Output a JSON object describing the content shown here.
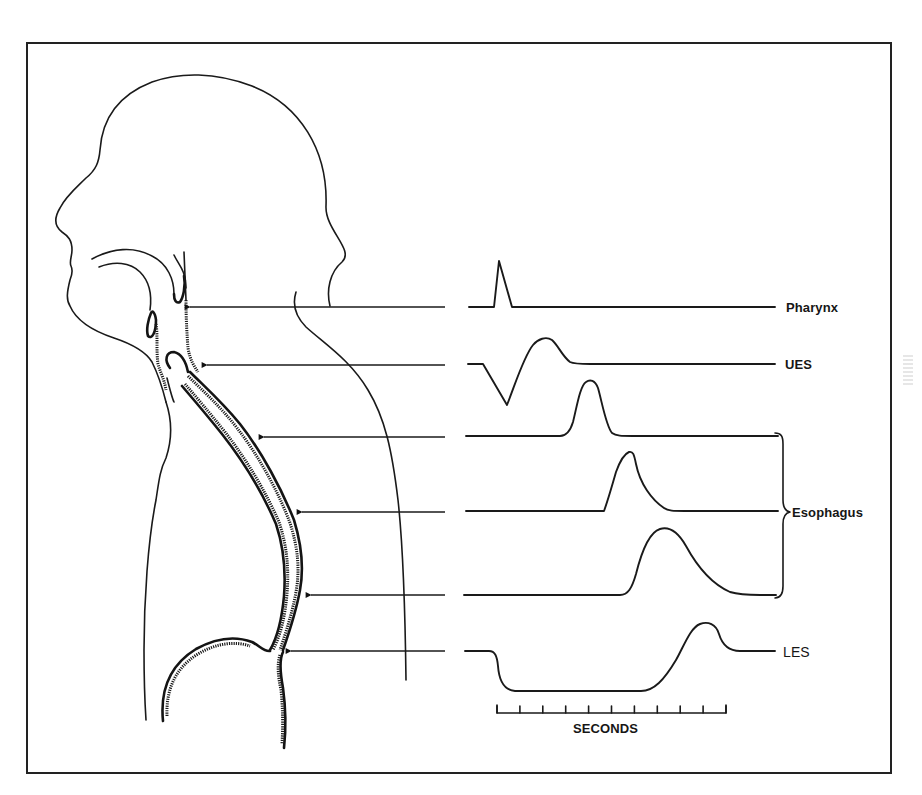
{
  "figure": {
    "type": "anatomical diagram with pressure tracings",
    "frame_color": "#222222",
    "ink_color": "#1a1a1a"
  },
  "labels": {
    "pharynx": "Pharynx",
    "ues": "UES",
    "esophagus": "Esophagus",
    "les": "LES",
    "time_axis": "SECONDS"
  },
  "probes": [
    {
      "name": "pharynx",
      "y": 307,
      "tip_x": 180,
      "line_end_x": 445
    },
    {
      "name": "ues",
      "y": 365,
      "tip_x": 197,
      "line_end_x": 445
    },
    {
      "name": "esophagus-upper",
      "y": 437,
      "tip_x": 254,
      "line_end_x": 445
    },
    {
      "name": "esophagus-middle",
      "y": 512,
      "tip_x": 294,
      "line_end_x": 445
    },
    {
      "name": "esophagus-lower",
      "y": 595,
      "tip_x": 303,
      "line_end_x": 445
    },
    {
      "name": "les",
      "y": 651,
      "tip_x": 283,
      "line_end_x": 445
    }
  ],
  "traces": [
    {
      "name": "pharynx",
      "baseline_y": 307,
      "x_start": 469,
      "x_end": 775,
      "shape": "sharp spike",
      "peak_x": 499,
      "peak_y": 260
    },
    {
      "name": "ues",
      "baseline_y": 364,
      "x_start": 468,
      "x_end": 775,
      "shape": "dip then positive wave",
      "trough_x": 507,
      "trough_y": 405,
      "peak_x": 543,
      "peak_y": 337
    },
    {
      "name": "esophagus-1",
      "baseline_y": 436,
      "x_start": 466,
      "x_end": 778,
      "shape": "peristaltic wave",
      "peak_x": 590,
      "peak_y": 381
    },
    {
      "name": "esophagus-2",
      "baseline_y": 511,
      "x_start": 466,
      "x_end": 778,
      "shape": "peristaltic wave",
      "peak_x": 630,
      "peak_y": 452
    },
    {
      "name": "esophagus-3",
      "baseline_y": 595,
      "x_start": 464,
      "x_end": 776,
      "shape": "peristaltic wave",
      "peak_x": 668,
      "peak_y": 528
    },
    {
      "name": "les",
      "baseline_y": 651,
      "x_start": 465,
      "x_end": 775,
      "shape": "relaxation then contraction",
      "relaxed_y": 692,
      "peak_x": 705,
      "peak_y": 623
    }
  ],
  "time_scale": {
    "x_start": 497,
    "x_end": 726,
    "y": 714,
    "ticks": 11,
    "intervals": 10,
    "unit_label": "SECONDS"
  }
}
